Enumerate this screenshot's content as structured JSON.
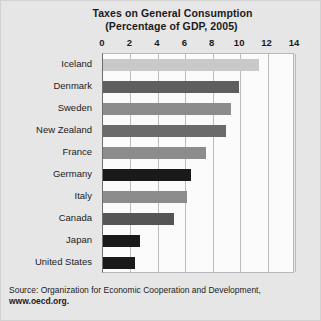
{
  "chart_data": {
    "type": "bar",
    "orientation": "horizontal",
    "title": "Taxes on General Consumption",
    "subtitle": "(Percentage of GDP, 2005)",
    "xlabel": "",
    "ylabel": "",
    "xlim": [
      0,
      14
    ],
    "xticks": [
      0,
      2,
      4,
      6,
      8,
      10,
      12,
      14
    ],
    "tick_labels": [
      "0",
      "2",
      "4",
      "6",
      "8",
      "10",
      "12",
      "14"
    ],
    "grid": true,
    "legend": "none",
    "categories": [
      "Iceland",
      "Denmark",
      "Sweden",
      "New Zealand",
      "France",
      "Germany",
      "Italy",
      "Canada",
      "Japan",
      "United States"
    ],
    "values": [
      11.4,
      9.9,
      9.3,
      9.0,
      7.5,
      6.4,
      6.1,
      5.2,
      2.7,
      2.3
    ],
    "bar_colors": [
      "#c9c9c9",
      "#5e5e5e",
      "#8c8c8c",
      "#6b6b6b",
      "#8c8c8c",
      "#1a1a1a",
      "#8c8c8c",
      "#555555",
      "#1a1a1a",
      "#1a1a1a"
    ]
  },
  "source": {
    "text": "Source: Organization for Economic Cooperation and Development,",
    "url": "www.oecd.org."
  },
  "colors": {
    "background": "#e6e6e6",
    "plot_background": "#fbfbfb",
    "gridline": "#bcbcbc",
    "axis": "#5f5f5f",
    "text": "#1b1b1b"
  }
}
